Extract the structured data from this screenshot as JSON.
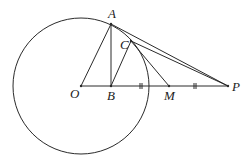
{
  "diagram": {
    "type": "geometry",
    "circle": {
      "center": "O",
      "cx": 81,
      "cy": 86,
      "r": 68
    },
    "points": [
      {
        "name": "A",
        "x": 111,
        "y": 24,
        "label": "A",
        "lx": 108,
        "ly": 18
      },
      {
        "name": "C",
        "x": 131,
        "y": 41,
        "label": "C",
        "lx": 120,
        "ly": 49
      },
      {
        "name": "O",
        "x": 81,
        "y": 86,
        "label": "O",
        "lx": 70,
        "ly": 98
      },
      {
        "name": "B",
        "x": 111,
        "y": 86,
        "label": "B",
        "lx": 107,
        "ly": 100
      },
      {
        "name": "M",
        "x": 169,
        "y": 86,
        "label": "M",
        "lx": 164,
        "ly": 100
      },
      {
        "name": "P",
        "x": 228,
        "y": 86,
        "label": "P",
        "lx": 232,
        "ly": 91
      }
    ],
    "segments": [
      [
        "O",
        "A"
      ],
      [
        "A",
        "B"
      ],
      [
        "B",
        "C"
      ],
      [
        "O",
        "P"
      ],
      [
        "A",
        "P"
      ],
      [
        "C",
        "P"
      ],
      [
        "C",
        "M"
      ]
    ],
    "tick_marks": [
      {
        "between": [
          "B",
          "M"
        ],
        "x": 141,
        "y": 86,
        "count": 2
      },
      {
        "between": [
          "M",
          "P"
        ],
        "x": 195,
        "y": 86,
        "count": 2
      }
    ]
  }
}
